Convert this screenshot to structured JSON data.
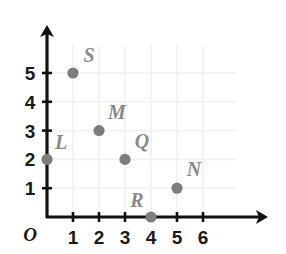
{
  "figure": {
    "kind": "coordinate-plane-scatter",
    "background_color": "#ffffff",
    "axis_color": "#111111",
    "grid_color": "#f1f1f1",
    "point_color": "#7d7d7d",
    "point_label_color": "#8a8a8a",
    "tick_label_color": "#1a1a1a",
    "origin_label": "O"
  },
  "chart_data": {
    "type": "scatter",
    "title": "",
    "xlabel": "",
    "ylabel": "",
    "xlim": [
      0,
      6
    ],
    "ylim": [
      0,
      5
    ],
    "grid": true,
    "legend": "none",
    "x_ticks": [
      "1",
      "2",
      "3",
      "4",
      "5",
      "6"
    ],
    "y_ticks": [
      "5",
      "4",
      "3",
      "2",
      "1"
    ],
    "x_tick_values": [
      1,
      2,
      3,
      4,
      5,
      6
    ],
    "y_tick_values": [
      5,
      4,
      3,
      2,
      1
    ],
    "origin_label": "O",
    "points": [
      {
        "label": "L",
        "x": 0,
        "y": 2,
        "label_dx": 14,
        "label_dy": -10
      },
      {
        "label": "S",
        "x": 1,
        "y": 5,
        "label_dx": 16,
        "label_dy": -11
      },
      {
        "label": "M",
        "x": 2,
        "y": 3,
        "label_dx": 18,
        "label_dy": -12
      },
      {
        "label": "Q",
        "x": 3,
        "y": 2,
        "label_dx": 17,
        "label_dy": -11
      },
      {
        "label": "R",
        "x": 4,
        "y": 0,
        "label_dx": -14,
        "label_dy": -10
      },
      {
        "label": "N",
        "x": 5,
        "y": 1,
        "label_dx": 17,
        "label_dy": -12
      }
    ]
  },
  "geometry": {
    "origin_px": {
      "x": 47,
      "y": 217
    },
    "x_step_px": 26,
    "y_step_px": 28.8,
    "x_axis_end_px": 268,
    "y_axis_end_px": 25,
    "grid_right_px": 236,
    "grid_top_px": 45,
    "dot_radius_px": 5.6,
    "tick_half_len_px": 5
  },
  "cropped_top_text": "·"
}
